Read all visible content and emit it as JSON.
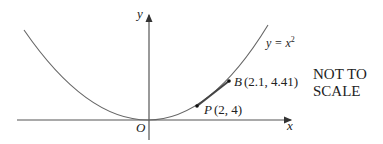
{
  "diagram": {
    "axes": {
      "x_label": "x",
      "y_label": "y",
      "origin_label": "O"
    },
    "curve": {
      "label": "y = x",
      "label_exponent": "2"
    },
    "points": [
      {
        "name": "P",
        "coords": "(2, 4)"
      },
      {
        "name": "B",
        "coords": "(2.1, 4.41)"
      }
    ],
    "note_line1": "NOT TO",
    "note_line2": "SCALE"
  }
}
